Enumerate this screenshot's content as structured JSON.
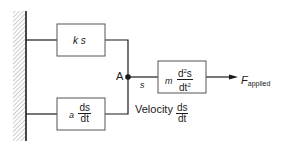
{
  "diagram": {
    "wall": {
      "label": "fixed-support"
    },
    "spring_box": {
      "coef": "k",
      "var": "s"
    },
    "damper_box": {
      "coef": "a",
      "num": "ds",
      "den": "dt"
    },
    "mass_box": {
      "coef": "m",
      "num": "d²s",
      "num_base": "d",
      "num_sup": "2",
      "num_tail": "s",
      "den_base": "dt",
      "den_sup": "2"
    },
    "node": {
      "label": "A"
    },
    "displacement": {
      "label": "s"
    },
    "velocity": {
      "prefix": "Velocity",
      "num": "ds",
      "den": "dt"
    },
    "force": {
      "base": "F",
      "sub": "applied"
    }
  },
  "colors": {
    "line": "#1a1a1a",
    "box_border": "#555555",
    "hatch": "#9a9a9a"
  }
}
